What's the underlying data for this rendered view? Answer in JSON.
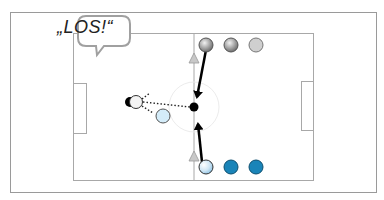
{
  "diagram": {
    "type": "soccer-drill",
    "speech_bubble": {
      "text": "„LOS!“"
    },
    "colors": {
      "frame": "#9a9a9a",
      "pitch_line": "#a8a8a8",
      "team_gray": "#bdbdbd",
      "team_blue": "#1a84b8",
      "light_blue": "#cfe9f7",
      "ball": "#000000",
      "cone": "#bcbcbc"
    },
    "players": {
      "top_row": [
        {
          "id": "gray-1",
          "style": "dark-gray-gradient"
        },
        {
          "id": "gray-2",
          "style": "dark-gray-gradient"
        },
        {
          "id": "gray-3",
          "style": "light-gray"
        }
      ],
      "bottom_row": [
        {
          "id": "blue-1",
          "style": "light-blue-gradient"
        },
        {
          "id": "blue-2",
          "style": "blue"
        },
        {
          "id": "blue-3",
          "style": "blue"
        }
      ],
      "field": [
        {
          "id": "white-player",
          "style": "white-with-black-shadow"
        },
        {
          "id": "light-blue-player",
          "style": "light-blue"
        },
        {
          "id": "center-ball",
          "style": "black"
        }
      ]
    },
    "cones": [
      {
        "id": "cone-top"
      },
      {
        "id": "cone-bottom"
      }
    ],
    "arrows": [
      {
        "id": "run-top-to-center",
        "style": "solid"
      },
      {
        "id": "run-bottom-to-center",
        "style": "solid"
      },
      {
        "id": "pass-center-to-left",
        "style": "dotted"
      }
    ]
  }
}
